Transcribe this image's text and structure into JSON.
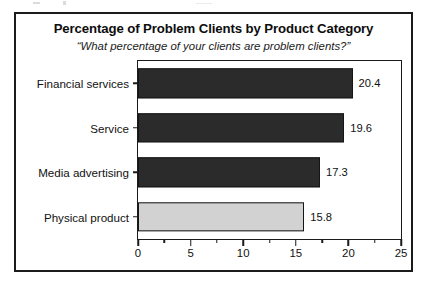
{
  "figure": {
    "title": "Percentage of Problem Clients by Product Category",
    "subtitle": "“What percentage of your clients are problem clients?”"
  },
  "chart_data": {
    "type": "bar",
    "orientation": "horizontal",
    "title": "Percentage of Problem Clients by Product Category",
    "subtitle": "“What percentage of your clients are problem clients?”",
    "xlabel": "",
    "ylabel": "",
    "categories": [
      "Financial services",
      "Service",
      "Media advertising",
      "Physical product"
    ],
    "values": [
      20.4,
      19.6,
      17.3,
      15.8
    ],
    "value_labels": [
      "20.4",
      "19.6",
      "17.3",
      "15.8"
    ],
    "bar_colors": [
      "#2b2b2b",
      "#2b2b2b",
      "#2b2b2b",
      "#d2d2d2"
    ],
    "bar_edge_color": "#151515",
    "xlim": [
      0,
      25
    ],
    "xticks": [
      0,
      5,
      10,
      15,
      20,
      25
    ],
    "xtick_labels": [
      "0",
      "5",
      "10",
      "15",
      "20",
      "25"
    ],
    "minor_xticks": [
      2.5,
      7.5,
      12.5,
      17.5,
      22.5
    ],
    "grid": false,
    "legend": false
  }
}
